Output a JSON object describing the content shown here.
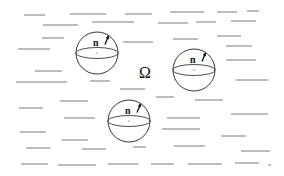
{
  "figure": {
    "domain_label": "Ω",
    "domain_label_pos": {
      "x": 139,
      "y": 78
    },
    "normal_label": "n",
    "colors": {
      "background": "#ffffff",
      "strokes": "#7a7a7a",
      "outline": "#3a3a3a",
      "text": "#111111"
    },
    "spheres": [
      {
        "id": "sphere-1",
        "cx": 97,
        "cy": 53,
        "r": 21,
        "equator_ry": 5.5,
        "label": "n"
      },
      {
        "id": "sphere-2",
        "cx": 194,
        "cy": 70,
        "r": 21,
        "equator_ry": 5.5,
        "label": "n"
      },
      {
        "id": "sphere-3",
        "cx": 129,
        "cy": 121,
        "r": 21,
        "equator_ry": 5.5,
        "label": "n"
      }
    ],
    "background_strokes": [
      [
        24,
        15,
        45
      ],
      [
        70,
        14,
        106
      ],
      [
        125,
        14,
        152
      ],
      [
        170,
        12,
        204
      ],
      [
        217,
        12,
        237
      ],
      [
        247,
        11,
        259
      ],
      [
        43,
        25,
        78
      ],
      [
        92,
        22,
        134
      ],
      [
        158,
        23,
        188
      ],
      [
        196,
        22,
        216
      ],
      [
        231,
        21,
        256
      ],
      [
        42,
        38,
        64
      ],
      [
        18,
        49,
        50
      ],
      [
        123,
        42,
        153
      ],
      [
        173,
        39,
        198
      ],
      [
        217,
        36,
        241
      ],
      [
        226,
        46,
        252
      ],
      [
        35,
        71,
        62
      ],
      [
        16,
        82,
        67
      ],
      [
        90,
        81,
        110
      ],
      [
        226,
        60,
        256
      ],
      [
        236,
        80,
        268
      ],
      [
        120,
        89,
        145
      ],
      [
        60,
        101,
        88
      ],
      [
        156,
        97,
        174
      ],
      [
        195,
        100,
        223
      ],
      [
        19,
        108,
        43
      ],
      [
        64,
        118,
        95
      ],
      [
        167,
        118,
        200
      ],
      [
        231,
        114,
        268
      ],
      [
        20,
        132,
        46
      ],
      [
        162,
        129,
        200
      ],
      [
        62,
        140,
        88
      ],
      [
        221,
        136,
        246
      ],
      [
        26,
        148,
        50
      ],
      [
        82,
        149,
        106
      ],
      [
        133,
        147,
        146
      ],
      [
        174,
        146,
        205
      ],
      [
        241,
        151,
        270
      ],
      [
        21,
        164,
        48
      ],
      [
        58,
        165,
        96
      ],
      [
        108,
        164,
        138
      ],
      [
        151,
        164,
        174
      ],
      [
        188,
        164,
        222
      ],
      [
        235,
        163,
        259
      ],
      [
        268,
        165,
        271
      ]
    ]
  }
}
